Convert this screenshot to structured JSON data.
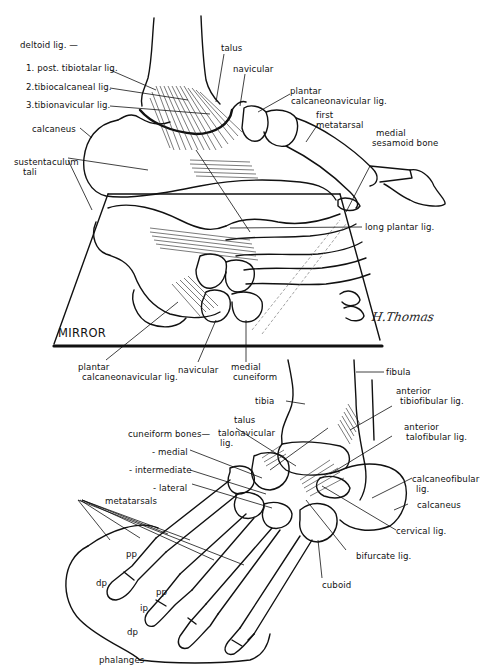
{
  "figure": {
    "artist_signature": "H.Thomas",
    "top_view": {
      "labels": {
        "deltoid": "deltoid lig. —",
        "post_tibiotalar": "1. post. tibiotalar lig.",
        "tibiocalcaneal": "2.tibiocalcaneal lig.",
        "tibionavicular": "3.tibionavicular lig.",
        "calcaneus": "calcaneus",
        "sustentaculum_1": "sustentaculum",
        "sustentaculum_2": "tali",
        "talus": "talus",
        "navicular": "navicular",
        "plantar_cn_1": "plantar",
        "plantar_cn_2": "calcaneonavicular lig.",
        "first_metatarsal_1": "first",
        "first_metatarsal_2": "metatarsal",
        "medial_sesamoid_1": "medial",
        "medial_sesamoid_2": "sesamoid bone",
        "long_plantar": "long plantar lig.",
        "mirror": "MIRROR",
        "mirror_plantar_cn_1": "plantar",
        "mirror_plantar_cn_2": "calcaneonavicular lig.",
        "mirror_navicular": "navicular",
        "mirror_medial_cuneiform_1": "medial",
        "mirror_medial_cuneiform_2": "cuneiform"
      }
    },
    "bottom_view": {
      "labels": {
        "fibula": "fibula",
        "tibia": "tibia",
        "anterior_tibiofibular_1": "anterior",
        "anterior_tibiofibular_2": "tibiofibular lig.",
        "talus": "talus",
        "talonavicular_1": "talonavicular",
        "talonavicular_2": "lig.",
        "anterior_talofibular_1": "anterior",
        "anterior_talofibular_2": "talofibular lig.",
        "cuneiform_bones": "cuneiform bones—",
        "medial": "- medial",
        "intermediate": "- intermediate",
        "lateral": "- lateral",
        "calcaneofibular_1": "calcaneofibular",
        "calcaneofibular_2": "lig.",
        "metatarsals": "metatarsals",
        "calcaneus": "calcaneus",
        "cervical": "cervical lig.",
        "bifurcate": "bifurcate lig.",
        "cuboid": "cuboid",
        "pp_1": "pp",
        "dp_1": "dp",
        "pp_2": "pp",
        "ip": "ip",
        "dp_2": "dp",
        "phalanges": "phalanges"
      }
    }
  }
}
